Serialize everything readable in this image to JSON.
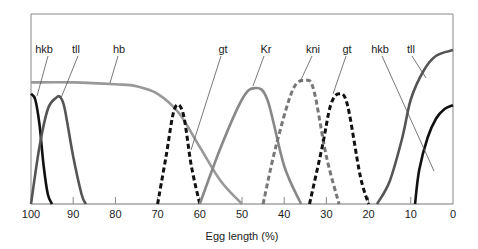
{
  "chart_data": {
    "type": "line",
    "title": "",
    "xlabel": "Egg length (%)",
    "ylabel": "",
    "xlim": [
      100,
      0
    ],
    "ylim": [
      0,
      1
    ],
    "x_ticks": [
      100,
      90,
      80,
      70,
      60,
      50,
      40,
      30,
      20,
      10,
      0
    ],
    "grid": false,
    "legend": "inline labels with leader lines",
    "series": [
      {
        "name": "hkb",
        "region": "anterior",
        "style": "solid",
        "color": "#111111",
        "x": [
          100,
          99,
          98,
          97,
          96,
          95
        ],
        "y": [
          0.58,
          0.55,
          0.42,
          0.2,
          0.05,
          0
        ]
      },
      {
        "name": "tll",
        "region": "anterior",
        "style": "solid",
        "color": "#555555",
        "x": [
          100,
          98,
          96,
          94,
          93,
          92,
          90,
          88,
          87
        ],
        "y": [
          0,
          0.3,
          0.5,
          0.56,
          0.56,
          0.5,
          0.25,
          0.05,
          0
        ]
      },
      {
        "name": "hb",
        "region": "anterior",
        "style": "solid",
        "color": "#999999",
        "x": [
          100,
          90,
          80,
          75,
          70,
          65,
          60,
          55,
          50
        ],
        "y": [
          0.64,
          0.64,
          0.63,
          0.62,
          0.58,
          0.48,
          0.3,
          0.12,
          0
        ]
      },
      {
        "name": "gt",
        "region": "anterior",
        "style": "dashed",
        "color": "#111111",
        "x": [
          70,
          68,
          66,
          64,
          62,
          60
        ],
        "y": [
          0,
          0.25,
          0.5,
          0.48,
          0.2,
          0
        ]
      },
      {
        "name": "Kr",
        "region": "central",
        "style": "solid",
        "color": "#888888",
        "x": [
          60,
          55,
          50,
          47,
          44,
          40,
          36
        ],
        "y": [
          0,
          0.3,
          0.55,
          0.61,
          0.55,
          0.2,
          0
        ]
      },
      {
        "name": "kni",
        "region": "central-posterior",
        "style": "dashed",
        "color": "#777777",
        "x": [
          45,
          42,
          38,
          35,
          33,
          30,
          27
        ],
        "y": [
          0,
          0.3,
          0.6,
          0.65,
          0.6,
          0.25,
          0
        ]
      },
      {
        "name": "gt",
        "region": "posterior",
        "style": "dashed",
        "color": "#111111",
        "x": [
          34,
          31,
          29,
          27,
          25,
          22,
          20
        ],
        "y": [
          0,
          0.3,
          0.52,
          0.58,
          0.52,
          0.15,
          0
        ]
      },
      {
        "name": "tll",
        "region": "posterior",
        "style": "solid",
        "color": "#555555",
        "x": [
          18,
          15,
          12,
          10,
          7,
          4,
          0
        ],
        "y": [
          0,
          0.12,
          0.35,
          0.55,
          0.7,
          0.78,
          0.81
        ]
      },
      {
        "name": "hkb",
        "region": "posterior",
        "style": "solid",
        "color": "#111111",
        "x": [
          9,
          8,
          6,
          4,
          2,
          0
        ],
        "y": [
          0,
          0.18,
          0.35,
          0.45,
          0.5,
          0.52
        ]
      }
    ],
    "annotations": [
      {
        "text": "hkb",
        "x_px": 44,
        "y_px": 53
      },
      {
        "text": "tll",
        "x_px": 76,
        "y_px": 53
      },
      {
        "text": "hb",
        "x_px": 119,
        "y_px": 53
      },
      {
        "text": "gt",
        "x_px": 223,
        "y_px": 53
      },
      {
        "text": "Kr",
        "x_px": 266,
        "y_px": 53
      },
      {
        "text": "kni",
        "x_px": 313,
        "y_px": 53
      },
      {
        "text": "gt",
        "x_px": 347,
        "y_px": 53
      },
      {
        "text": "hkb",
        "x_px": 380,
        "y_px": 53
      },
      {
        "text": "tll",
        "x_px": 411,
        "y_px": 53
      }
    ]
  }
}
